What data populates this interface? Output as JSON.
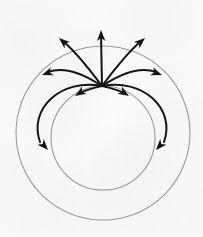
{
  "figure": {
    "kind": "vector-field-line-diagram",
    "caption": "",
    "background_color": "#fcfcfc",
    "canvas": {
      "width": 203,
      "height": 237
    }
  },
  "style": {
    "circle_stroke_color": "#9a9a9a",
    "circle_stroke_width": 1.1,
    "fieldline_stroke_color": "#141414",
    "fieldline_stroke_width": 2.0,
    "arrowhead_color": "#141414"
  },
  "geometry": {
    "outer_circle": {
      "label": "outer boundary circle",
      "cx": 103,
      "cy": 133,
      "r": 87
    },
    "inner_circle": {
      "label": "inner boundary circle",
      "cx": 103,
      "cy": 138,
      "r": 52
    },
    "source_point": {
      "label": "field source point",
      "x": 102,
      "y": 86
    }
  },
  "chart_data": {
    "type": "scatter",
    "xlabel": "",
    "ylabel": "",
    "grid": false,
    "legend_position": "none",
    "xlim": [
      0,
      203
    ],
    "ylim": [
      0,
      237
    ],
    "circles": [
      {
        "name": "outer boundary circle",
        "cx": 103,
        "cy": 133,
        "r": 87,
        "color": "#9a9a9a"
      },
      {
        "name": "inner boundary circle",
        "cx": 103,
        "cy": 138,
        "r": 52,
        "color": "#9a9a9a"
      }
    ],
    "source_point": {
      "x": 102,
      "y": 86
    },
    "series": [
      {
        "name": "fieldline-vertical-up",
        "path": "M 102 86 L 101 34",
        "arrow_tip": {
          "x": 101,
          "y": 30
        },
        "arrow_angle_deg": -91
      },
      {
        "name": "fieldline-left-long",
        "path": "M 102 86 C 90 70 78 54 64 42",
        "arrow_tip": {
          "x": 59,
          "y": 38
        },
        "arrow_angle_deg": -139
      },
      {
        "name": "fieldline-left-medium",
        "path": "M 102 86 C 84 74 64 66 48 72",
        "arrow_tip": {
          "x": 42,
          "y": 75
        },
        "arrow_angle_deg": 160
      },
      {
        "name": "fieldline-left-short",
        "path": "M 102 86 C 93 88 86 90 80 93",
        "arrow_tip": {
          "x": 75,
          "y": 96
        },
        "arrow_angle_deg": 148
      },
      {
        "name": "fieldline-right-long",
        "path": "M 102 86 C 114 70 126 54 140 42",
        "arrow_tip": {
          "x": 145,
          "y": 38
        },
        "arrow_angle_deg": -41
      },
      {
        "name": "fieldline-right-medium",
        "path": "M 102 86 C 120 74 140 66 156 72",
        "arrow_tip": {
          "x": 162,
          "y": 75
        },
        "arrow_angle_deg": 20
      },
      {
        "name": "fieldline-right-short",
        "path": "M 102 86 C 111 88 118 90 124 93",
        "arrow_tip": {
          "x": 129,
          "y": 96
        },
        "arrow_angle_deg": 32
      },
      {
        "name": "fieldline-left-outer-loop",
        "path": "M 102 86 C 62 78 28 108 40 142",
        "arrow_tip": {
          "x": 48,
          "y": 150
        },
        "arrow_angle_deg": 48
      },
      {
        "name": "fieldline-right-outer-loop",
        "path": "M 102 86 C 142 78 176 108 164 142",
        "arrow_tip": {
          "x": 156,
          "y": 150
        },
        "arrow_angle_deg": 132
      }
    ]
  }
}
